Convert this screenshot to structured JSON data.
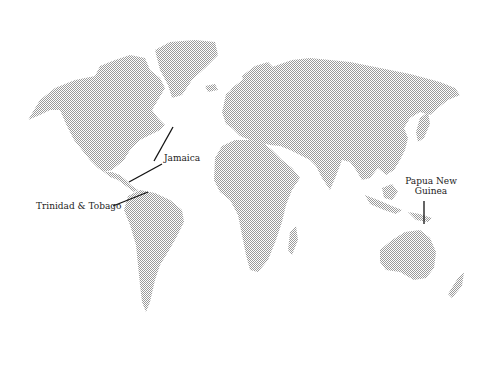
{
  "map": {
    "title": "World map",
    "land_color": "#b8b8b8",
    "background_color": "#ffffff",
    "leader_color": "#111111",
    "labels": [
      {
        "id": "jamaica",
        "text": "Jamaica"
      },
      {
        "id": "trinidad",
        "text": "Trinidad & Tobago"
      },
      {
        "id": "png",
        "line1": "Papua New",
        "line2": "Guinea"
      }
    ]
  }
}
